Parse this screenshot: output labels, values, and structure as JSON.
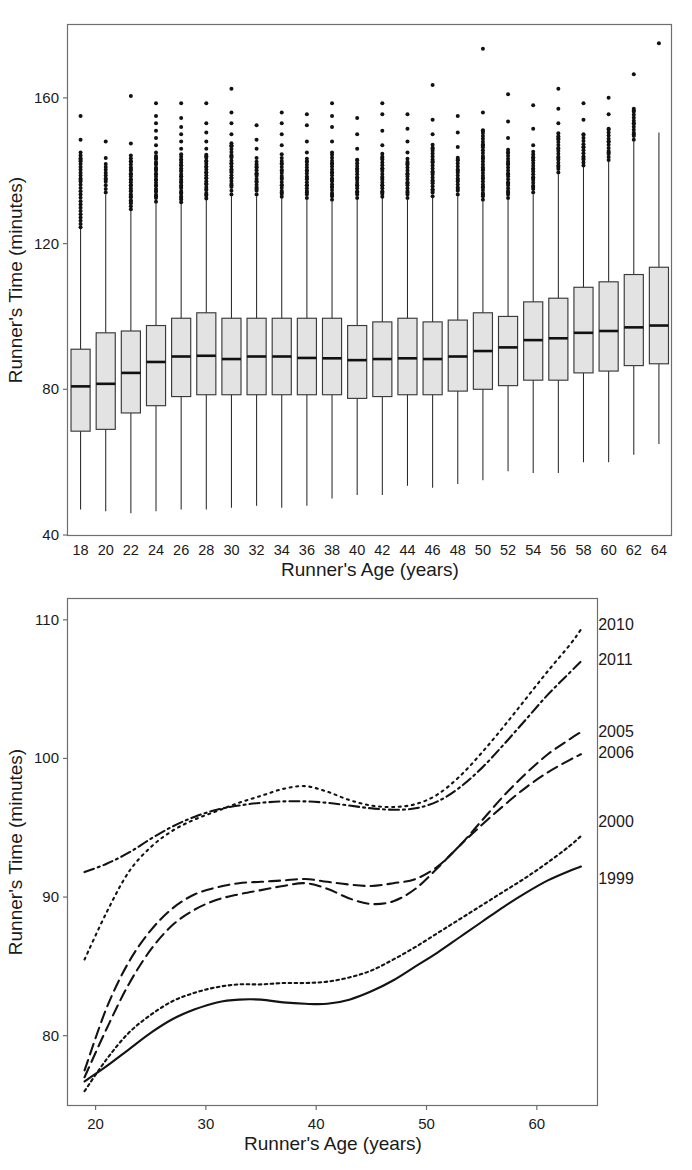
{
  "figure": {
    "panel_top_name": "boxplot-panel",
    "panel_bottom_name": "smoothed-curves-panel",
    "stroke_color": "#131313",
    "box_fill_color": "#e3e3e3",
    "frame_color": "#6e6e6e"
  },
  "chart_data": [
    {
      "type": "box",
      "title": "",
      "xlabel": "Runner's Age (years)",
      "ylabel": "Runner's Time (minutes)",
      "xlim": [
        17,
        65
      ],
      "ylim": [
        40,
        180
      ],
      "yticks": [
        40,
        80,
        120,
        160
      ],
      "ytick_labels": [
        "40",
        "80",
        "120",
        "160"
      ],
      "grid": false,
      "legend": "none",
      "categories": [
        18,
        20,
        22,
        24,
        26,
        28,
        30,
        32,
        34,
        36,
        38,
        40,
        42,
        44,
        46,
        48,
        50,
        52,
        54,
        56,
        58,
        60,
        62,
        64
      ],
      "xtick_labels": [
        "18",
        "20",
        "22",
        "24",
        "26",
        "28",
        "30",
        "32",
        "34",
        "36",
        "38",
        "40",
        "42",
        "44",
        "46",
        "48",
        "50",
        "52",
        "54",
        "56",
        "58",
        "60",
        "62",
        "64"
      ],
      "boxes": [
        {
          "age": 18,
          "whisker_low": 47.0,
          "q1": 68.5,
          "median": 80.8,
          "q3": 91.0,
          "whisker_high": 124.0,
          "outliers": [
            137.5,
            143.0,
            148.5,
            155.0
          ]
        },
        {
          "age": 20,
          "whisker_low": 46.5,
          "q1": 69.0,
          "median": 81.5,
          "q3": 95.5,
          "whisker_high": 133.5,
          "outliers": [
            137.5,
            143.5,
            148.0
          ]
        },
        {
          "age": 22,
          "whisker_low": 46.0,
          "q1": 73.5,
          "median": 84.5,
          "q3": 96.0,
          "whisker_high": 129.0,
          "outliers": [
            131.5,
            133.0,
            134.5,
            136.0,
            137.5,
            139.0,
            140.5,
            142.5,
            147.5,
            160.5
          ]
        },
        {
          "age": 24,
          "whisker_low": 46.5,
          "q1": 75.5,
          "median": 87.5,
          "q3": 97.5,
          "whisker_high": 131.0,
          "outliers": [
            133.0,
            134.5,
            136.0,
            137.5,
            139.0,
            140.5,
            142.0,
            143.5,
            145.0,
            147.0,
            149.0,
            151.0,
            153.0,
            155.0,
            158.5
          ]
        },
        {
          "age": 26,
          "whisker_low": 47.0,
          "q1": 78.0,
          "median": 89.0,
          "q3": 99.5,
          "whisker_high": 131.0,
          "outliers": [
            132.5,
            134.0,
            135.5,
            137.0,
            138.5,
            140.0,
            141.5,
            143.0,
            144.5,
            146.0,
            148.0,
            150.0,
            152.0,
            154.5,
            158.5
          ]
        },
        {
          "age": 28,
          "whisker_low": 47.0,
          "q1": 78.5,
          "median": 89.2,
          "q3": 101.0,
          "whisker_high": 132.0,
          "outliers": [
            133.5,
            135.0,
            136.5,
            138.0,
            139.5,
            141.0,
            142.5,
            144.0,
            146.0,
            148.0,
            150.5,
            153.0,
            158.5
          ]
        },
        {
          "age": 30,
          "whisker_low": 47.5,
          "q1": 78.5,
          "median": 88.3,
          "q3": 99.5,
          "whisker_high": 133.0,
          "outliers": [
            136.0,
            138.0,
            140.0,
            142.0,
            144.0,
            147.0,
            150.0,
            153.0,
            156.0,
            162.5
          ]
        },
        {
          "age": 32,
          "whisker_low": 48.0,
          "q1": 78.5,
          "median": 89.0,
          "q3": 99.5,
          "whisker_high": 133.0,
          "outliers": [
            135.0,
            137.0,
            139.0,
            141.0,
            143.5,
            146.0,
            148.5,
            152.5
          ]
        },
        {
          "age": 34,
          "whisker_low": 47.5,
          "q1": 78.5,
          "median": 89.0,
          "q3": 99.5,
          "whisker_high": 132.5,
          "outliers": [
            134.0,
            136.0,
            138.0,
            140.0,
            142.0,
            144.5,
            147.0,
            150.0,
            153.0,
            156.0
          ]
        },
        {
          "age": 36,
          "whisker_low": 48.0,
          "q1": 78.5,
          "median": 88.6,
          "q3": 99.5,
          "whisker_high": 132.0,
          "outliers": [
            134.0,
            136.0,
            138.0,
            140.0,
            142.5,
            145.0,
            148.0,
            152.5,
            155.5
          ]
        },
        {
          "age": 38,
          "whisker_low": 50.0,
          "q1": 78.5,
          "median": 88.5,
          "q3": 99.5,
          "whisker_high": 131.5,
          "outliers": [
            133.5,
            135.5,
            137.5,
            139.5,
            142.0,
            145.0,
            148.0,
            152.0,
            155.0,
            158.5
          ]
        },
        {
          "age": 40,
          "whisker_low": 51.0,
          "q1": 77.5,
          "median": 88.0,
          "q3": 97.5,
          "whisker_high": 132.0,
          "outliers": [
            134.0,
            136.0,
            138.0,
            140.5,
            143.0,
            146.0,
            150.0,
            154.5
          ]
        },
        {
          "age": 42,
          "whisker_low": 51.0,
          "q1": 78.0,
          "median": 88.3,
          "q3": 98.5,
          "whisker_high": 132.5,
          "outliers": [
            134.0,
            136.0,
            138.0,
            140.5,
            143.5,
            147.0,
            151.0,
            155.5,
            158.5
          ]
        },
        {
          "age": 44,
          "whisker_low": 53.5,
          "q1": 78.5,
          "median": 88.5,
          "q3": 99.5,
          "whisker_high": 132.0,
          "outliers": [
            134.0,
            136.5,
            139.0,
            142.0,
            145.0,
            148.0,
            151.5,
            155.5
          ]
        },
        {
          "age": 46,
          "whisker_low": 53.0,
          "q1": 78.5,
          "median": 88.3,
          "q3": 98.5,
          "whisker_high": 132.5,
          "outliers": [
            134.5,
            137.0,
            139.5,
            142.5,
            146.0,
            150.0,
            154.0,
            163.5
          ]
        },
        {
          "age": 48,
          "whisker_low": 54.0,
          "q1": 79.5,
          "median": 89.0,
          "q3": 99.0,
          "whisker_high": 133.0,
          "outliers": [
            135.0,
            137.5,
            140.0,
            143.0,
            146.5,
            150.5,
            155.0
          ]
        },
        {
          "age": 50,
          "whisker_low": 55.0,
          "q1": 80.0,
          "median": 90.5,
          "q3": 101.0,
          "whisker_high": 131.5,
          "outliers": [
            133.5,
            135.5,
            138.0,
            140.5,
            143.5,
            147.0,
            151.0,
            156.0,
            173.5
          ]
        },
        {
          "age": 52,
          "whisker_low": 57.5,
          "q1": 81.0,
          "median": 91.5,
          "q3": 100.0,
          "whisker_high": 132.0,
          "outliers": [
            134.0,
            136.5,
            139.0,
            142.0,
            145.0,
            149.0,
            153.5,
            161.0
          ]
        },
        {
          "age": 54,
          "whisker_low": 57.0,
          "q1": 82.5,
          "median": 93.5,
          "q3": 104.0,
          "whisker_high": 133.5,
          "outliers": [
            135.5,
            138.0,
            140.5,
            143.5,
            147.0,
            151.5,
            158.0
          ]
        },
        {
          "age": 56,
          "whisker_low": 57.0,
          "q1": 82.5,
          "median": 94.0,
          "q3": 105.0,
          "whisker_high": 139.0,
          "outliers": [
            141.0,
            143.5,
            146.0,
            149.0,
            153.0,
            157.0,
            162.5
          ]
        },
        {
          "age": 58,
          "whisker_low": 60.0,
          "q1": 84.5,
          "median": 95.5,
          "q3": 108.0,
          "whisker_high": 141.0,
          "outliers": [
            143.5,
            146.5,
            150.0,
            154.0,
            158.5
          ]
        },
        {
          "age": 60,
          "whisker_low": 60.0,
          "q1": 85.0,
          "median": 96.0,
          "q3": 109.5,
          "whisker_high": 142.5,
          "outliers": [
            145.0,
            148.0,
            151.5,
            155.5,
            160.0
          ]
        },
        {
          "age": 62,
          "whisker_low": 62.0,
          "q1": 86.5,
          "median": 97.0,
          "q3": 111.5,
          "whisker_high": 148.0,
          "outliers": [
            150.0,
            153.0,
            156.5,
            166.5
          ]
        },
        {
          "age": 64,
          "whisker_low": 65.0,
          "q1": 87.0,
          "median": 97.5,
          "q3": 113.5,
          "whisker_high": 150.5,
          "outliers": [
            175.0
          ]
        }
      ]
    },
    {
      "type": "line",
      "title": "",
      "xlabel": "Runner's Age (years)",
      "ylabel": "Runner's Time (minutes)",
      "xlim": [
        17.5,
        65.5
      ],
      "ylim": [
        75.0,
        111.5
      ],
      "xticks": [
        20,
        30,
        40,
        50,
        60
      ],
      "xtick_labels": [
        "20",
        "30",
        "40",
        "50",
        "60"
      ],
      "yticks": [
        80,
        90,
        100,
        110
      ],
      "ytick_labels": [
        "80",
        "90",
        "100",
        "110"
      ],
      "grid": false,
      "legend": "inline-right-labels",
      "x": [
        19,
        21,
        23,
        25,
        27,
        29,
        31,
        33,
        35,
        37,
        39,
        41,
        43,
        45,
        47,
        49,
        51,
        53,
        55,
        57,
        59,
        61,
        63,
        64
      ],
      "series": [
        {
          "name": "1999",
          "style": "solid",
          "label_x": 65.2,
          "label_y": 91.3,
          "values": [
            76.7,
            77.8,
            79.0,
            80.2,
            81.2,
            81.9,
            82.4,
            82.6,
            82.6,
            82.4,
            82.3,
            82.3,
            82.6,
            83.2,
            84.0,
            85.0,
            86.0,
            87.1,
            88.2,
            89.3,
            90.3,
            91.2,
            91.9,
            92.2
          ]
        },
        {
          "name": "2000",
          "style": "fine-dotted",
          "label_x": 65.2,
          "label_y": 95.4,
          "values": [
            76.0,
            78.3,
            80.2,
            81.5,
            82.5,
            83.1,
            83.5,
            83.7,
            83.7,
            83.8,
            83.8,
            83.9,
            84.2,
            84.7,
            85.5,
            86.4,
            87.4,
            88.4,
            89.4,
            90.4,
            91.4,
            92.5,
            93.7,
            94.4
          ]
        },
        {
          "name": "2005",
          "style": "dashed",
          "label_x": 65.2,
          "label_y": 101.9,
          "values": [
            77.5,
            82.0,
            85.3,
            87.6,
            89.2,
            90.2,
            90.7,
            91.0,
            91.1,
            91.2,
            91.3,
            91.1,
            90.9,
            90.8,
            91.0,
            91.3,
            92.2,
            93.7,
            95.5,
            97.3,
            98.9,
            100.3,
            101.4,
            101.9
          ]
        },
        {
          "name": "2006",
          "style": "dashed",
          "label_x": 65.2,
          "label_y": 100.4,
          "values": [
            77.0,
            80.5,
            83.7,
            86.2,
            88.0,
            89.1,
            89.8,
            90.2,
            90.5,
            90.8,
            91.0,
            90.6,
            89.9,
            89.5,
            89.7,
            90.6,
            92.1,
            93.7,
            95.2,
            96.6,
            97.9,
            99.0,
            99.9,
            100.3
          ]
        },
        {
          "name": "2010",
          "style": "dotted",
          "label_x": 65.2,
          "label_y": 109.6,
          "values": [
            85.5,
            88.9,
            91.8,
            93.6,
            94.8,
            95.6,
            96.2,
            96.8,
            97.3,
            97.8,
            98.0,
            97.6,
            97.0,
            96.6,
            96.5,
            96.7,
            97.4,
            98.7,
            100.4,
            102.3,
            104.3,
            106.3,
            108.2,
            109.3
          ]
        },
        {
          "name": "2011",
          "style": "dash-dotted",
          "label_x": 65.2,
          "label_y": 107.1,
          "values": [
            91.8,
            92.4,
            93.2,
            94.2,
            95.1,
            95.8,
            96.3,
            96.6,
            96.8,
            96.9,
            96.9,
            96.8,
            96.6,
            96.4,
            96.3,
            96.4,
            96.9,
            97.9,
            99.3,
            101.0,
            102.8,
            104.6,
            106.2,
            107.0
          ]
        }
      ]
    }
  ]
}
